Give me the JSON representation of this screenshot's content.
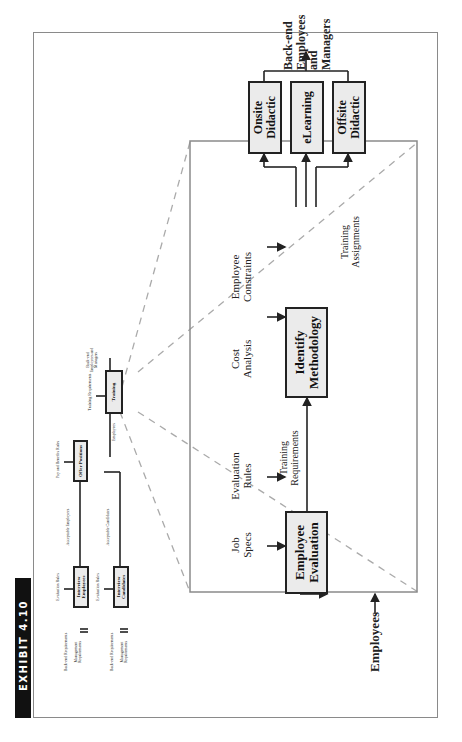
{
  "exhibit": {
    "label": "EXHIBIT 4.10",
    "color": "#111111"
  },
  "overview": {
    "interview_employees": {
      "label": "Interview Employees",
      "control": "Evaluation Rules",
      "inputs": [
        "Back-end Requirements",
        "Management Requirements"
      ]
    },
    "interview_candidates": {
      "label": "Interview Candidates",
      "control": "Evaluation Rules",
      "inputs": [
        "Back-end Requirements",
        "Management Requirements"
      ]
    },
    "offer_positions": {
      "label": "Offer Positions",
      "control": "Pay and Benefits Rules",
      "inputs": [
        "Acceptable Employees",
        "Acceptable Candidates"
      ],
      "output": "Employees"
    },
    "training": {
      "label": "Training",
      "control": "Training Requirements",
      "output": "Back-end Employees and Managers"
    }
  },
  "detail": {
    "input": "Employees",
    "employee_evaluation": {
      "label_line1": "Employee",
      "label_line2": "Evaluation",
      "controls": [
        {
          "l1": "Job",
          "l2": "Specs"
        },
        {
          "l1": "Evaluation",
          "l2": "Rules"
        }
      ]
    },
    "flow_label": {
      "l1": "Training",
      "l2": "Requirements"
    },
    "identify_methodology": {
      "label_line1": "Identify",
      "label_line2": "Methodology",
      "controls": [
        {
          "l1": "Cost",
          "l2": "Analysis"
        },
        {
          "l1": "Employee",
          "l2": "Constraints"
        }
      ]
    },
    "assignments_label": {
      "l1": "Training",
      "l2": "Assignments"
    },
    "methods": [
      {
        "l1": "Onsite",
        "l2": "Didactic"
      },
      {
        "l1": "eLearning",
        "l2": ""
      },
      {
        "l1": "Offsite",
        "l2": "Didactic"
      }
    ],
    "output": {
      "l1": "Back-end",
      "l2": "Employees",
      "l3": "and",
      "l4": "Managers"
    }
  }
}
